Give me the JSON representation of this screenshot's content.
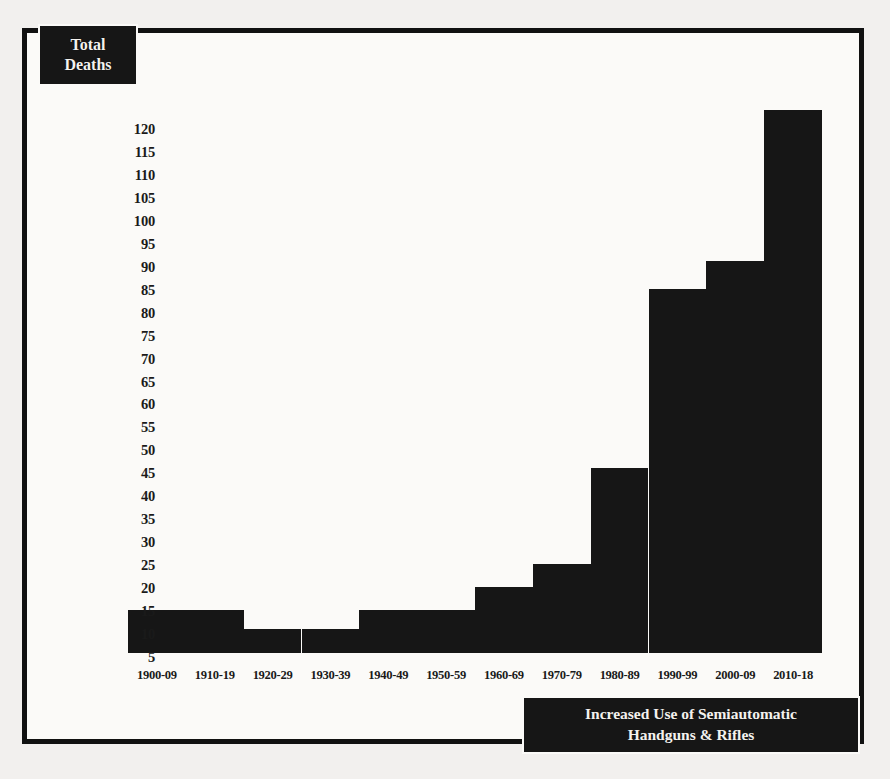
{
  "figure": {
    "y_axis_title_line1": "Total",
    "y_axis_title_line2": "Deaths",
    "caption_line1": "Increased Use of Semiautomatic",
    "caption_line2": "Handguns & Rifles",
    "bar_color": "#161616",
    "background_color": "#fbfaf8",
    "frame_color": "#111111"
  },
  "chart_data": {
    "type": "bar",
    "title": "Total Deaths",
    "xlabel": "",
    "ylabel": "Total Deaths",
    "ylim": [
      0,
      125
    ],
    "grid": false,
    "legend": "none",
    "y_ticks": [
      120,
      115,
      110,
      105,
      100,
      95,
      90,
      85,
      80,
      75,
      70,
      65,
      60,
      55,
      50,
      45,
      40,
      35,
      30,
      25,
      20,
      15,
      10,
      5
    ],
    "categories": [
      "1900-09",
      "1910-19",
      "1920-29",
      "1930-39",
      "1940-49",
      "1950-59",
      "1960-69",
      "1970-79",
      "1980-89",
      "1990-99",
      "2000-09",
      "2010-18"
    ],
    "values": [
      13,
      13,
      9,
      9,
      13,
      13,
      18,
      23,
      44,
      83,
      89,
      122
    ],
    "annotations": [
      "Increased Use of Semiautomatic Handguns & Rifles"
    ]
  }
}
